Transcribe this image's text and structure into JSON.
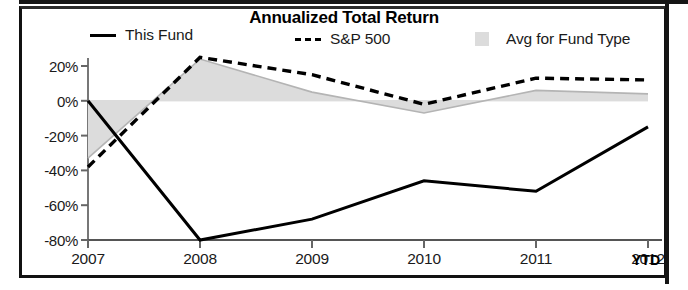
{
  "chart_data": {
    "type": "line",
    "title": "Annualized Total Return",
    "xlabel": "",
    "ylabel": "",
    "categories": [
      "2007",
      "2008",
      "2009",
      "2010",
      "2011",
      "2012"
    ],
    "x_axis_note": "YTD",
    "ylim": [
      -80,
      20
    ],
    "y_ticks": [
      20,
      0,
      -20,
      -40,
      -60,
      -80
    ],
    "y_tick_labels": [
      "20%",
      "0%",
      "-20%",
      "-40%",
      "-60%",
      "-80%"
    ],
    "grid": false,
    "legend_position": "top",
    "series": [
      {
        "name": "This Fund",
        "style": "solid-line",
        "color": "#000000",
        "values": [
          0,
          -80,
          -68,
          -46,
          -52,
          -15
        ]
      },
      {
        "name": "S&P 500",
        "style": "dashed-line",
        "color": "#000000",
        "values": [
          -38,
          25,
          15,
          -2,
          13,
          12
        ]
      },
      {
        "name": "Avg for Fund Type",
        "style": "filled-area",
        "color": "#dcdcdc",
        "values": [
          -33,
          24,
          5,
          -7,
          6,
          4
        ]
      }
    ]
  },
  "legend": {
    "items": [
      {
        "label": "This Fund",
        "swatch": "solid-line-swatch"
      },
      {
        "label": "S&P 500",
        "swatch": "dashed-line-swatch"
      },
      {
        "label": "Avg for Fund Type",
        "swatch": "area-fill-swatch"
      }
    ]
  }
}
